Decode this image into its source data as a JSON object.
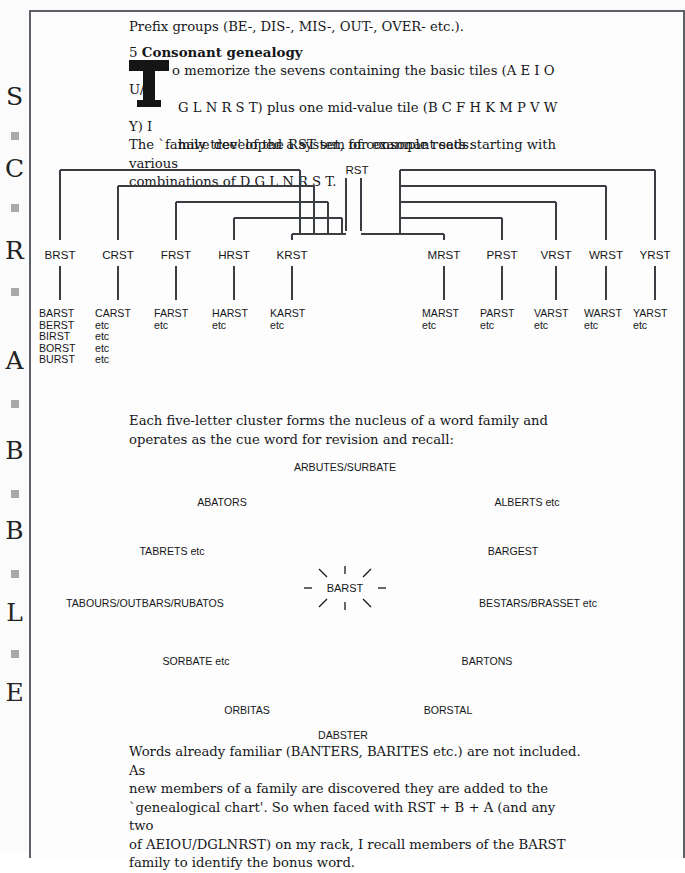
{
  "page": {
    "margin_heading_letters": [
      "S",
      "C",
      "R",
      "A",
      "B",
      "B",
      "L",
      "E"
    ]
  },
  "body": {
    "prefix_line": "Prefix groups (BE-, DIS-, MIS-, OUT-, OVER- etc.).",
    "section_number": "5",
    "section_title": "Consonant genealogy",
    "dropcap": "T",
    "intro_line1": "o memorize the sevens containing the basic tiles (A E I O U/D",
    "intro_line2": "G L N R S T) plus one mid-value tile (B C F H K M P V W Y) I",
    "intro_line3": "have developed a system of consonant sets starting with various",
    "intro_line4": "combinations of D G L N R S T.",
    "tree_lead": "The `family tree' of the RST set, for example reads:",
    "cluster_lead_line1": "Each five-letter cluster forms the nucleus of a word family and",
    "cluster_lead_line2": "operates as the cue word for revision and recall:",
    "closing_line1": "Words already familiar (BANTERS, BARITES etc.) are not included. As",
    "closing_line2": "new members of a family are discovered they are added to the",
    "closing_line3": "`genealogical chart'. So when faced with RST + B + A (and any two",
    "closing_line4": "of AEIOU/DGLNRST) on my rack, I recall members of the BARST",
    "closing_line5": "family to identify the bonus word."
  },
  "tree": {
    "root": "RST",
    "nodes": [
      {
        "label": "BRST",
        "x": 60,
        "desc": [
          "BARST",
          "BERST",
          "BIRST",
          "BORST",
          "BURST"
        ]
      },
      {
        "label": "CRST",
        "x": 118,
        "desc": [
          "CARST",
          "etc",
          "etc",
          "etc",
          "etc"
        ]
      },
      {
        "label": "FRST",
        "x": 176,
        "desc": [
          "FARST",
          "etc"
        ]
      },
      {
        "label": "HRST",
        "x": 234,
        "desc": [
          "HARST",
          "etc"
        ]
      },
      {
        "label": "KRST",
        "x": 292,
        "desc": [
          "KARST",
          "etc"
        ]
      },
      {
        "label": "MRST",
        "x": 444,
        "desc": [
          "MARST",
          "etc"
        ]
      },
      {
        "label": "PRST",
        "x": 502,
        "desc": [
          "PARST",
          "etc"
        ]
      },
      {
        "label": "VRST",
        "x": 556,
        "desc": [
          "VARST",
          "etc"
        ]
      },
      {
        "label": "WRST",
        "x": 606,
        "desc": [
          "WARST",
          "etc"
        ]
      },
      {
        "label": "YRST",
        "x": 655,
        "desc": [
          "YARST",
          "etc"
        ]
      }
    ]
  },
  "cluster": {
    "center": "BARST",
    "words": [
      {
        "text": "ARBUTES/SURBATE",
        "x": 345,
        "y": 461
      },
      {
        "text": "ABATORS",
        "x": 222,
        "y": 496
      },
      {
        "text": "ALBERTS etc",
        "x": 527,
        "y": 496
      },
      {
        "text": "TABRETS etc",
        "x": 172,
        "y": 545
      },
      {
        "text": "BARGEST",
        "x": 513,
        "y": 545
      },
      {
        "text": "TABOURS/OUTBARS/RUBATOS",
        "x": 145,
        "y": 597
      },
      {
        "text": "BESTARS/BRASSET etc",
        "x": 538,
        "y": 597
      },
      {
        "text": "SORBATE etc",
        "x": 196,
        "y": 655
      },
      {
        "text": "BARTONS",
        "x": 487,
        "y": 655
      },
      {
        "text": "ORBITAS",
        "x": 247,
        "y": 704
      },
      {
        "text": "BORSTAL",
        "x": 448,
        "y": 704
      },
      {
        "text": "DABSTER",
        "x": 343,
        "y": 729
      }
    ]
  },
  "colors": {
    "ink": "#15171a",
    "rule": "#3a3d42",
    "margin_square": "#a9a9a9",
    "paper": "#fdfdfd"
  }
}
